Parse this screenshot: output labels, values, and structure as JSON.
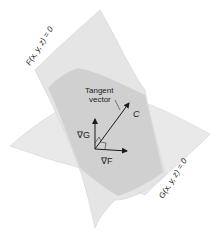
{
  "figure": {
    "surfaces": [
      {
        "name": "F",
        "label": "F(x, y, z) = 0",
        "fill": "#e6e6e6"
      },
      {
        "name": "G",
        "label": "G(x, y, z) = 0",
        "fill": "#e9e9e9"
      }
    ],
    "overlap_fill": "#cdcdcd",
    "curve_label": "C",
    "tangent_label_line1": "Tangent",
    "tangent_label_line2": "vector",
    "gradient_G_label": "∇G",
    "gradient_F_label": "∇F",
    "vector_color": "#1a1a1a"
  }
}
